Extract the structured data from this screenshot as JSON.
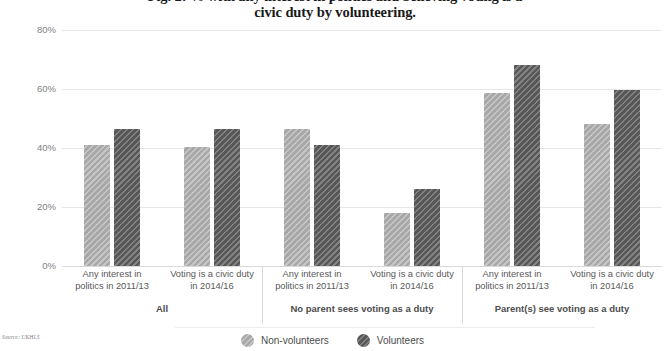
{
  "chart_data": {
    "type": "bar",
    "title": "Fig. 2: % with any interest in politics and believing voting is a civic duty by volunteering.",
    "title_line1": "Fig. 2: % with any interest in politics and believing voting is a",
    "title_line2": "civic duty by volunteering.",
    "xlabel": "",
    "ylabel": "",
    "ylim": [
      0,
      80
    ],
    "ytick_labels": [
      "0%",
      "20%",
      "40%",
      "60%",
      "80%"
    ],
    "ytick_values": [
      0,
      20,
      40,
      60,
      80
    ],
    "grid": true,
    "legend_position": "bottom",
    "categories": [
      "Any interest in politics in 2011/13",
      "Voting is a civic duty in 2014/16",
      "Any interest in politics in 2011/13",
      "Voting is a civic duty in 2014/16",
      "Any interest in politics in 2011/13",
      "Voting is a civic duty in 2014/16"
    ],
    "category_lines": [
      [
        "Any interest in",
        "politics in 2011/13"
      ],
      [
        "Voting is a civic duty",
        "in 2014/16"
      ],
      [
        "Any interest in",
        "politics in 2011/13"
      ],
      [
        "Voting is a civic duty",
        "in 2014/16"
      ],
      [
        "Any interest in",
        "politics in 2011/13"
      ],
      [
        "Voting is a civic duty",
        "in 2014/16"
      ]
    ],
    "groups": [
      {
        "label": "All",
        "categories": [
          0,
          1
        ]
      },
      {
        "label": "No parent sees voting as a duty",
        "categories": [
          2,
          3
        ]
      },
      {
        "label": "Parent(s) see voting as a duty",
        "categories": [
          4,
          5
        ]
      }
    ],
    "series": [
      {
        "name": "Non-volunteers",
        "color": "#a8a8a8",
        "values": [
          41,
          40.5,
          46.5,
          18,
          58.5,
          48
        ]
      },
      {
        "name": "Volunteers",
        "color": "#575757",
        "values": [
          46.5,
          46.5,
          41,
          26,
          68,
          59.5
        ]
      }
    ],
    "source": "Source: UKHLS"
  },
  "legend": {
    "items": [
      {
        "label": "Non-volunteers",
        "swatch": "light"
      },
      {
        "label": "Volunteers",
        "swatch": "dark"
      }
    ]
  }
}
